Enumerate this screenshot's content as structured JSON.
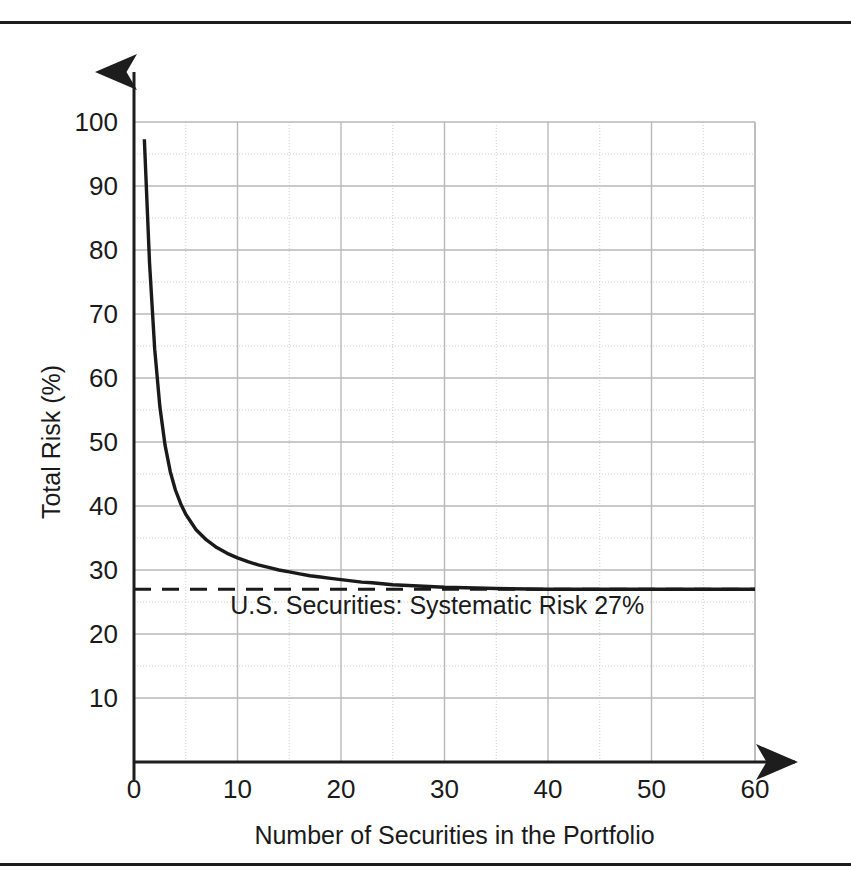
{
  "figure": {
    "background": "#ffffff",
    "border_color": "#1d1d1d",
    "axis_color": "#1d1d1d",
    "curve_color": "#1a1a1a",
    "grid_major_color": "#b9b9b9",
    "grid_minor_color": "#cfcfcf"
  },
  "chart_data": {
    "type": "line",
    "title": "",
    "subtitle": "",
    "xlabel": "Number of Securities in the Portfolio",
    "ylabel": "Total Risk (%)",
    "xlim": [
      0,
      60
    ],
    "ylim": [
      0,
      100
    ],
    "xticks": [
      0,
      10,
      20,
      30,
      40,
      50,
      60
    ],
    "yticks": [
      10,
      20,
      30,
      40,
      50,
      60,
      70,
      80,
      90,
      100
    ],
    "xtick_labels": [
      "0",
      "10",
      "20",
      "30",
      "40",
      "50",
      "60"
    ],
    "ytick_labels": [
      "10",
      "20",
      "30",
      "40",
      "50",
      "60",
      "70",
      "80",
      "90",
      "100"
    ],
    "grid": true,
    "grid_major_step_x": 10,
    "grid_minor_step_x": 5,
    "grid_major_step_y": 10,
    "grid_minor_step_y": 5,
    "legend": null,
    "legend_position": "none",
    "series": [
      {
        "name": "Total Risk",
        "style": "solid",
        "x": [
          1,
          1.5,
          2,
          2.5,
          3,
          3.5,
          4,
          4.5,
          5,
          6,
          7,
          8,
          9,
          10,
          11,
          12,
          13,
          14,
          15,
          16,
          17,
          18,
          19,
          20,
          21,
          22,
          23,
          25,
          30,
          35,
          40,
          45,
          50,
          55,
          60
        ],
        "values": [
          97.3,
          78.0,
          64.5,
          55.5,
          49.5,
          45.4,
          42.5,
          40.4,
          38.7,
          36.3,
          34.7,
          33.5,
          32.6,
          31.9,
          31.3,
          30.8,
          30.4,
          30.0,
          29.7,
          29.4,
          29.1,
          28.9,
          28.7,
          28.5,
          28.3,
          28.1,
          28.0,
          27.7,
          27.3,
          27.1,
          27.0,
          27.0,
          27.0,
          27.0,
          27.0
        ]
      },
      {
        "name": "Systematic Risk",
        "style": "dashed",
        "x": [
          0,
          60
        ],
        "values": [
          27,
          27
        ]
      }
    ],
    "annotations": [
      {
        "text": "U.S. Securities:  Systematic Risk 27%",
        "x": 23.5,
        "y": 24.0,
        "asymptote_value": 27
      }
    ]
  },
  "axes": {
    "y_axis_arrow": "arrow-up",
    "x_axis_arrow": "arrow-right"
  }
}
